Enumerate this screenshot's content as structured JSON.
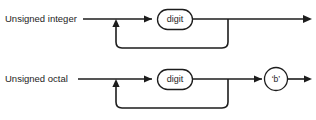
{
  "figure": {
    "background_color": "#ffffff",
    "line_color": "#1d1d1d",
    "diagrams": [
      {
        "id": "unsigned-integer",
        "label": "Unsigned integer",
        "nonterminal": "digit",
        "terminal": "",
        "has_terminal": false,
        "loop": "repeat-digit"
      },
      {
        "id": "unsigned-octal",
        "label": "Unsigned octal",
        "nonterminal": "digit",
        "terminal": "‘b’",
        "has_terminal": true,
        "loop": "repeat-digit"
      }
    ]
  }
}
